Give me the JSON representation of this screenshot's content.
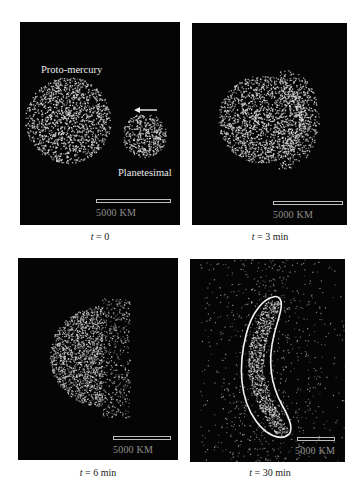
{
  "figure": {
    "panels": [
      {
        "id": "t0",
        "caption_var": "t",
        "caption_rest": " = 0",
        "labels": {
          "body1": "Proto-mercury",
          "body2": "Planetesimal"
        },
        "scale_label": "5000 KM",
        "arrow": "arrow-left"
      },
      {
        "id": "t3",
        "caption_var": "t",
        "caption_rest": " = 3 min",
        "scale_label": "5000 KM"
      },
      {
        "id": "t6",
        "caption_var": "t",
        "caption_rest": " = 6 min",
        "scale_label": "5000 KM"
      },
      {
        "id": "t30",
        "caption_var": "t",
        "caption_rest": " = 30 min",
        "scale_label": "5000 KM"
      }
    ],
    "colors": {
      "panel_bg": "#050505",
      "particles": "#d9d9d9",
      "outline": "#f2f2f2",
      "scale_text": "#8f8f8f"
    }
  }
}
